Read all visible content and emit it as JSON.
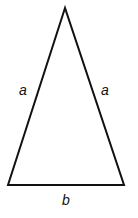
{
  "diagram": {
    "type": "isosceles-triangle",
    "stroke_color": "#111111",
    "background": "#ffffff",
    "vertices": {
      "apex": [
        65,
        8
      ],
      "bottom_left": [
        8,
        185
      ],
      "bottom_right": [
        124,
        185
      ]
    },
    "labels": {
      "left_side": "a",
      "right_side": "a",
      "base": "b"
    }
  }
}
